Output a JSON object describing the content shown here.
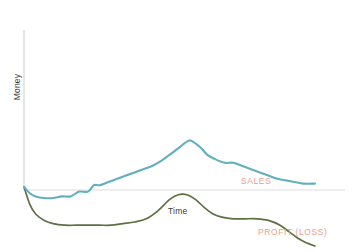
{
  "chart_data": {
    "type": "line",
    "title": "",
    "subtitle": "",
    "xlabel": "Time",
    "ylabel": "Money",
    "grid": false,
    "legend_position": "inline-right",
    "axis": {
      "x_axis_visible": true,
      "y_axis_visible": true,
      "x_tick_labels": [],
      "y_tick_labels": [],
      "xlim": [
        0,
        100
      ],
      "ylim": [
        -35,
        100
      ],
      "baseline_value": 0
    },
    "annotations": [
      {
        "name": "x-axis-label",
        "text": "Time"
      },
      {
        "name": "y-axis-label",
        "text": "Money"
      }
    ],
    "series": [
      {
        "name": "SALES",
        "label": "SALES",
        "color": "#62b0bd",
        "x": [
          0,
          2,
          4,
          7,
          10,
          13,
          16,
          19,
          22,
          24,
          26,
          29,
          32,
          35,
          38,
          41,
          44,
          47,
          50,
          53,
          55,
          57,
          59,
          61,
          63,
          66,
          69,
          72,
          75,
          78,
          81,
          84,
          87,
          90,
          93,
          96,
          100
        ],
        "values": [
          2,
          -2,
          -4,
          -5,
          -5,
          -4,
          -4,
          -1,
          -1,
          3,
          3,
          5,
          7,
          9,
          11,
          13,
          15,
          18,
          22,
          26,
          29,
          31,
          29,
          26,
          22,
          19,
          17,
          17,
          15,
          13,
          11,
          9,
          7,
          6,
          5,
          4,
          4
        ]
      },
      {
        "name": "PROFIT (LOSS)",
        "label": "PROFIT (LOSS)",
        "color": "#5d7042",
        "x": [
          0,
          2,
          4,
          7,
          10,
          14,
          18,
          22,
          26,
          30,
          34,
          38,
          42,
          46,
          50,
          53,
          56,
          59,
          62,
          65,
          68,
          72,
          76,
          80,
          84,
          88,
          91,
          94,
          97,
          100
        ],
        "values": [
          2,
          -9,
          -15,
          -19,
          -21,
          -22,
          -22,
          -22,
          -22,
          -22,
          -21,
          -20,
          -18,
          -13,
          -6,
          -3,
          -3,
          -6,
          -11,
          -15,
          -17,
          -18,
          -18,
          -18,
          -19,
          -22,
          -26,
          -30,
          -33,
          -35
        ]
      }
    ]
  },
  "style": {
    "axis_color": "#d4d4d4",
    "label_color": "#3b3b3b",
    "series_label_color": "#e8a08c",
    "background": "#ffffff"
  }
}
